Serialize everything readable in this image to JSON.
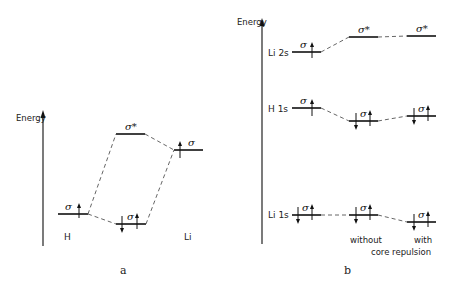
{
  "panel_a": {
    "caption": "a",
    "axis_label": "Energy",
    "levels": [
      {
        "id": "H",
        "orbital": "σ",
        "electrons": "↑"
      },
      {
        "id": "bonding",
        "orbital": "σ",
        "electrons": "↓↑"
      },
      {
        "id": "antibonding",
        "orbital": "σ*",
        "electrons": ""
      },
      {
        "id": "Li",
        "orbital": "σ",
        "electrons": "↑"
      }
    ],
    "atom_labels": {
      "left": "H",
      "right": "Li"
    }
  },
  "panel_b": {
    "caption": "b",
    "axis_label": "Energy",
    "row_labels": [
      "Li 2s",
      "H 1s",
      "Li 1s"
    ],
    "columns": [
      "",
      "without",
      "with"
    ],
    "column_footer": "core repulsion",
    "levels": [
      {
        "row": "Li 2s",
        "col": 0,
        "orbital": "σ",
        "electrons": "↑"
      },
      {
        "row": "Li 2s",
        "col": 1,
        "orbital": "σ*",
        "electrons": ""
      },
      {
        "row": "Li 2s",
        "col": 2,
        "orbital": "σ*",
        "electrons": ""
      },
      {
        "row": "H 1s",
        "col": 0,
        "orbital": "σ",
        "electrons": "↑"
      },
      {
        "row": "H 1s",
        "col": 1,
        "orbital": "σ",
        "electrons": "↓↑"
      },
      {
        "row": "H 1s",
        "col": 2,
        "orbital": "σ",
        "electrons": "↓↑"
      },
      {
        "row": "Li 1s",
        "col": 0,
        "orbital": "σ",
        "electrons": "↓↑"
      },
      {
        "row": "Li 1s",
        "col": 1,
        "orbital": "σ",
        "electrons": "↓↑"
      },
      {
        "row": "Li 1s",
        "col": 2,
        "orbital": "σ",
        "electrons": "↓↑"
      }
    ]
  }
}
